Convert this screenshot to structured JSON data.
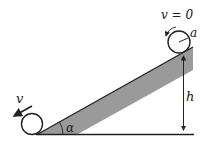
{
  "diagram": {
    "labels": {
      "top_velocity": "v = 0",
      "radius": "a",
      "height": "h",
      "angle": "α",
      "bottom_velocity": "v"
    },
    "colors": {
      "stroke": "#222222",
      "incline_fill": "#9a9a9a",
      "background": "#ffffff"
    }
  }
}
